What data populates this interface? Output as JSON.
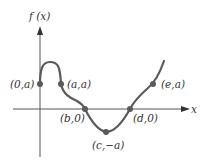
{
  "diagram": {
    "type": "function-graph",
    "y_axis_label": "f (x)",
    "x_axis_label": "x",
    "colors": {
      "axis": "#555555",
      "curve": "#5a5a5a",
      "point": "#5a5a5a",
      "text": "#333333"
    },
    "points": [
      {
        "id": "p0a",
        "label": "(0,a)"
      },
      {
        "id": "paa",
        "label": "(a,a)"
      },
      {
        "id": "pb0",
        "label": "(b,0)"
      },
      {
        "id": "pcna",
        "label": "(c,−a)"
      },
      {
        "id": "pd0",
        "label": "(d,0)"
      },
      {
        "id": "pea",
        "label": "(e,a)"
      }
    ]
  }
}
